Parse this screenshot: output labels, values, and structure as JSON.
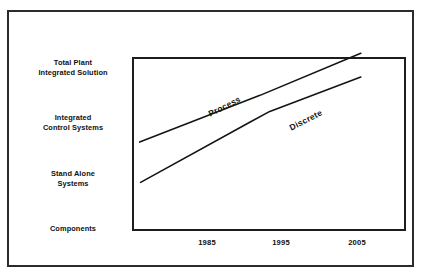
{
  "chart_data": {
    "type": "line",
    "title": "",
    "subtitle": "",
    "xlabel": "",
    "ylabel": "",
    "grid": false,
    "legend_position": "inline-on-curve",
    "x_tick_labels": [
      "1985",
      "1995",
      "2005"
    ],
    "x_tick_values": [
      1985,
      1995,
      2005
    ],
    "y_tick_labels": [
      "Total Plant\nIntegrated Solution",
      "Integrated\nControl Systems",
      "Stand Alone\nSystems",
      "Components"
    ],
    "y_categories_top_to_bottom": [
      "Total Plant Integrated Solution",
      "Integrated Control Systems",
      "Stand Alone Systems",
      "Components"
    ],
    "y_levels": [
      4,
      3,
      2,
      1
    ],
    "xlim": [
      1980,
      2008
    ],
    "ylim": [
      0.5,
      4.3
    ],
    "series": [
      {
        "name": "Process",
        "label": "Process",
        "color": "#141414",
        "points": [
          {
            "x": 1981.7,
            "y": 2.18
          },
          {
            "x": 1994.0,
            "y": 3.2
          },
          {
            "x": 2004.3,
            "y": 4.12
          }
        ]
      },
      {
        "name": "Discrete",
        "label": "Discrete",
        "color": "#141414",
        "points": [
          {
            "x": 1981.8,
            "y": 1.3
          },
          {
            "x": 1993.0,
            "y": 2.62
          },
          {
            "x": 1995.0,
            "y": 2.85
          },
          {
            "x": 2004.3,
            "y": 3.6
          }
        ]
      }
    ]
  },
  "axes": {
    "y_labels": [
      "Total Plant\nIntegrated Solution",
      "Integrated\nControl Systems",
      "Stand Alone\nSystems",
      "Components"
    ],
    "x_labels": [
      "1985",
      "1995",
      "2005"
    ]
  },
  "series_labels": {
    "process": "Process",
    "discrete": "Discrete"
  },
  "colors": {
    "ink": "#141414",
    "frame": "#2b2b2b",
    "plot_border": "#1d1d1d",
    "background": "#ffffff"
  }
}
